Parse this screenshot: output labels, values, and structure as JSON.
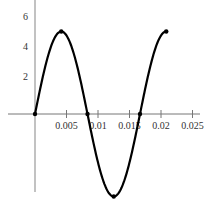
{
  "chart_data": {
    "type": "line",
    "title": "",
    "xlabel": "",
    "ylabel": "",
    "function": "5.5 * sin(2*pi*60*t)",
    "amplitude": 5.5,
    "frequency_hz": 60,
    "x_range": [
      0,
      0.0208
    ],
    "xlim": [
      -0.005,
      0.026
    ],
    "ylim": [
      -5.5,
      7.5
    ],
    "x_ticks": [
      0.005,
      0.01,
      0.015,
      0.02,
      0.025
    ],
    "x_tick_labels": [
      "0.005",
      "0.01",
      "0.015",
      "0.02",
      "0.025"
    ],
    "y_ticks": [
      2,
      4,
      6
    ],
    "y_tick_labels": [
      "2",
      "4",
      "6"
    ],
    "series": [
      {
        "name": "sine",
        "x": [
          0,
          0.002083,
          0.004167,
          0.00625,
          0.008333,
          0.010417,
          0.0125,
          0.014583,
          0.016667,
          0.01875,
          0.020833
        ],
        "y": [
          0,
          3.89,
          5.5,
          3.89,
          0,
          -3.89,
          -5.5,
          -3.89,
          0,
          3.89,
          5.5
        ]
      }
    ],
    "markers": [
      {
        "x": 0,
        "y": 0
      },
      {
        "x": 0.004167,
        "y": 5.5
      },
      {
        "x": 0.008333,
        "y": 0
      },
      {
        "x": 0.0125,
        "y": -5.5
      },
      {
        "x": 0.016667,
        "y": 0
      },
      {
        "x": 0.020833,
        "y": 5.5
      }
    ],
    "grid": false,
    "legend": "none",
    "colors": {
      "line": "#000000",
      "axis": "#888888"
    }
  }
}
